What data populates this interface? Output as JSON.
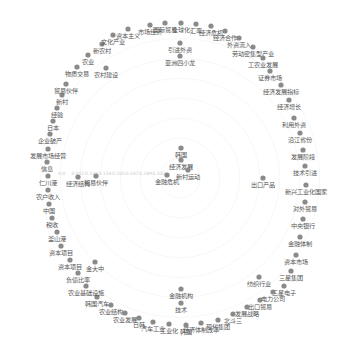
{
  "chart_data": {
    "type": "graph",
    "layout": "circular",
    "center": [
      180,
      178
    ],
    "radius": 155,
    "radial_axis_ticks": [
      "0.0",
      "0.051",
      "0.103",
      "0.154",
      "0.205",
      "0.247",
      "0.289",
      "0.332"
    ],
    "node_color": "#8a8a8a",
    "label_color": "#555555",
    "outer_nodes": [
      {
        "x": 181,
        "y": 23,
        "label": "全球化"
      },
      {
        "x": 196,
        "y": 24,
        "label": "汇率"
      },
      {
        "x": 211,
        "y": 26,
        "label": "经济危机"
      },
      {
        "x": 225,
        "y": 31,
        "label": "经济合作"
      },
      {
        "x": 239,
        "y": 38,
        "label": "外资流入"
      },
      {
        "x": 253,
        "y": 47,
        "label": "劳动密集型产业"
      },
      {
        "x": 263,
        "y": 58,
        "label": "工农业发展"
      },
      {
        "x": 270,
        "y": 71,
        "label": "证券市场"
      },
      {
        "x": 281,
        "y": 85,
        "label": "经济发展指标"
      },
      {
        "x": 289,
        "y": 100,
        "label": "经济增长"
      },
      {
        "x": 294,
        "y": 118,
        "label": "利用外资"
      },
      {
        "x": 300,
        "y": 133,
        "label": "沿江省份"
      },
      {
        "x": 303,
        "y": 150,
        "label": "发展阶段"
      },
      {
        "x": 305,
        "y": 166,
        "label": "技术引进"
      },
      {
        "x": 306,
        "y": 185,
        "label": "新兴工业化国家"
      },
      {
        "x": 305,
        "y": 202,
        "label": "对外贸易"
      },
      {
        "x": 303,
        "y": 219,
        "label": "中央银行"
      },
      {
        "x": 300,
        "y": 237,
        "label": "金融体制"
      },
      {
        "x": 296,
        "y": 255,
        "label": "资本市场"
      },
      {
        "x": 291,
        "y": 271,
        "label": "三星集团"
      },
      {
        "x": 284,
        "y": 286,
        "label": "三星电子"
      },
      {
        "x": 273,
        "y": 292,
        "label": "电力公司"
      },
      {
        "x": 260,
        "y": 300,
        "label": "出口贸易"
      },
      {
        "x": 247,
        "y": 307,
        "label": "发展战略"
      },
      {
        "x": 233,
        "y": 314,
        "label": "北斗三"
      },
      {
        "x": 218,
        "y": 320,
        "label": "现代集团"
      },
      {
        "x": 201,
        "y": 323,
        "label": "经济体制改革"
      },
      {
        "x": 186,
        "y": 325,
        "label": "韩国"
      },
      {
        "x": 169,
        "y": 324,
        "label": "工业化"
      },
      {
        "x": 153,
        "y": 322,
        "label": "汽车工业"
      },
      {
        "x": 139,
        "y": 318,
        "label": "日韩"
      },
      {
        "x": 125,
        "y": 313,
        "label": "农业发展"
      },
      {
        "x": 111,
        "y": 305,
        "label": "农业结构"
      },
      {
        "x": 97,
        "y": 297,
        "label": "韩国汽车"
      },
      {
        "x": 86,
        "y": 286,
        "label": "农业基础设施"
      },
      {
        "x": 78,
        "y": 273,
        "label": "负债比率"
      },
      {
        "x": 70,
        "y": 260,
        "label": "资本项目"
      },
      {
        "x": 61,
        "y": 246,
        "label": "资本项目"
      },
      {
        "x": 57,
        "y": 232,
        "label": "釜山港"
      },
      {
        "x": 52,
        "y": 218,
        "label": "税收"
      },
      {
        "x": 49,
        "y": 204,
        "label": "中国"
      },
      {
        "x": 48,
        "y": 190,
        "label": "农户收入"
      },
      {
        "x": 48,
        "y": 176,
        "label": "仁川港"
      },
      {
        "x": 47,
        "y": 162,
        "label": "信息"
      },
      {
        "x": 48,
        "y": 149,
        "label": "发展市场经营"
      },
      {
        "x": 50,
        "y": 134,
        "label": "企业破产"
      },
      {
        "x": 53,
        "y": 121,
        "label": "日本"
      },
      {
        "x": 57,
        "y": 108,
        "label": "经验"
      },
      {
        "x": 62,
        "y": 95,
        "label": "新村"
      },
      {
        "x": 66,
        "y": 84,
        "label": "贸易伙伴"
      },
      {
        "x": 77,
        "y": 67,
        "label": "物质交易"
      },
      {
        "x": 88,
        "y": 55,
        "label": "农业"
      },
      {
        "x": 102,
        "y": 44,
        "label": "新农村"
      },
      {
        "x": 113,
        "y": 35,
        "label": "文化产业"
      },
      {
        "x": 128,
        "y": 29,
        "label": "资本主义"
      },
      {
        "x": 150,
        "y": 25,
        "label": "市场经济"
      },
      {
        "x": 165,
        "y": 23,
        "label": "国际贸易"
      }
    ],
    "inner_nodes": [
      {
        "x": 180,
        "y": 43,
        "label": "引进外资"
      },
      {
        "x": 180,
        "y": 56,
        "label": "亚洲四小龙"
      },
      {
        "x": 106,
        "y": 68,
        "label": "农村建设"
      },
      {
        "x": 78,
        "y": 177,
        "label": "经济结构"
      },
      {
        "x": 96,
        "y": 176,
        "label": "贸易伙伴"
      },
      {
        "x": 181,
        "y": 148,
        "label": "韩国"
      },
      {
        "x": 181,
        "y": 160,
        "label": "经济发展"
      },
      {
        "x": 167,
        "y": 175,
        "label": "金融危机"
      },
      {
        "x": 188,
        "y": 170,
        "label": "新村运动"
      },
      {
        "x": 263,
        "y": 178,
        "label": "出口产品"
      },
      {
        "x": 259,
        "y": 277,
        "label": "纺织行业"
      },
      {
        "x": 95,
        "y": 262,
        "label": "金大中"
      },
      {
        "x": 181,
        "y": 289,
        "label": "金融机构"
      },
      {
        "x": 181,
        "y": 303,
        "label": "技术"
      }
    ]
  }
}
